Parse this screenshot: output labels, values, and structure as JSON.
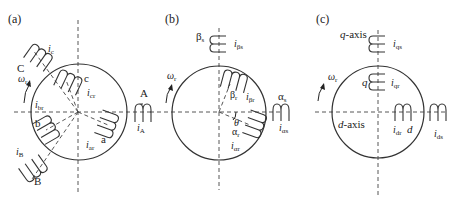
{
  "figure": {
    "panels": [
      {
        "id": "a",
        "tag": "(a)",
        "rotation_label": "ωr",
        "stator_windings": [
          {
            "name": "A",
            "current": "iA"
          },
          {
            "name": "B",
            "current": "iB"
          },
          {
            "name": "C",
            "current": "ic"
          }
        ],
        "rotor_windings": [
          {
            "name": "a",
            "current": "iar"
          },
          {
            "name": "b",
            "current": "ibr"
          },
          {
            "name": "c",
            "current": "icr"
          }
        ]
      },
      {
        "id": "b",
        "tag": "(b)",
        "rotation_label": "ωr",
        "stator_windings": [
          {
            "name": "αs",
            "current": "iαs"
          },
          {
            "name": "βs",
            "current": "iβs"
          }
        ],
        "rotor_windings": [
          {
            "name": "αr",
            "current": "iαr"
          },
          {
            "name": "βr",
            "current": "iβr"
          }
        ],
        "angle_label": "θ"
      },
      {
        "id": "c",
        "tag": "(c)",
        "rotation_label": "ωr",
        "axes": [
          "q-axis",
          "d-axis"
        ],
        "stator_windings": [
          {
            "name": "q",
            "current": "iqs"
          },
          {
            "name": "d",
            "current": "ids"
          }
        ],
        "rotor_windings": [
          {
            "name": "q",
            "current": "iqr"
          },
          {
            "name": "d",
            "current": "idr"
          }
        ]
      }
    ]
  }
}
